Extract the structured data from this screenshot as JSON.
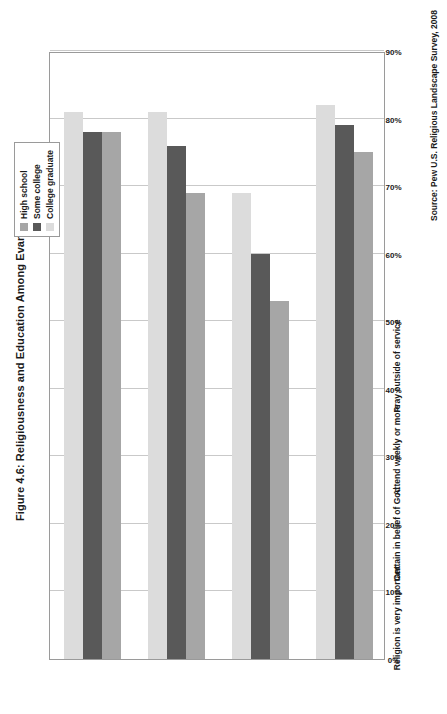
{
  "figure": {
    "title": "Figure 4.6: Religiousness and Education Among Evangelicals",
    "source": "Source: Pew U.S. Religious Landscape Survey, 2008"
  },
  "legend": {
    "items": [
      {
        "label": "High school",
        "color": "#a6a6a6"
      },
      {
        "label": "Some college",
        "color": "#595959"
      },
      {
        "label": "College graduate",
        "color": "#dcdcdc"
      }
    ]
  },
  "chart_data": {
    "type": "bar",
    "title": "Figure 4.6: Religiousness and Education Among Evangelicals",
    "xlabel": "",
    "ylabel": "",
    "orientation": "horizontal",
    "grid": true,
    "legend_position": "top-right",
    "ylim": [
      0,
      90
    ],
    "yticks": [
      0,
      10,
      20,
      30,
      40,
      50,
      60,
      70,
      80,
      90
    ],
    "ticklabels": [
      "0%",
      "10%",
      "20%",
      "30%",
      "40%",
      "50%",
      "60%",
      "70%",
      "80%",
      "90%"
    ],
    "categories": [
      "Religion is very important",
      "Certain in belief of God",
      "Attend weekly or more",
      "Pray outside of service"
    ],
    "series": [
      {
        "name": "High school",
        "color": "#a6a6a6",
        "values": [
          78,
          69,
          53,
          75
        ]
      },
      {
        "name": "Some college",
        "color": "#595959",
        "values": [
          78,
          76,
          60,
          79
        ]
      },
      {
        "name": "College graduate",
        "color": "#dcdcdc",
        "values": [
          81,
          81,
          69,
          82
        ]
      }
    ]
  }
}
